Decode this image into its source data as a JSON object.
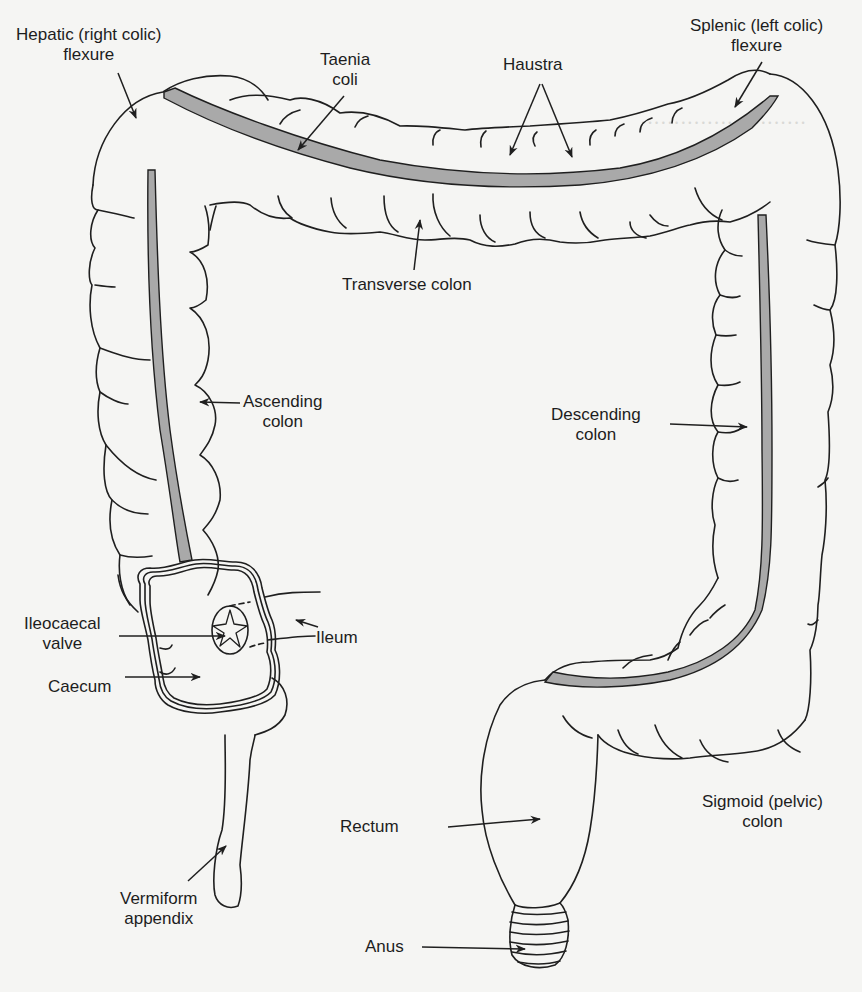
{
  "figure": {
    "colors": {
      "background": "#f5f5f3",
      "outline": "#1f1f1f",
      "taenia_fill": "#a9a9a9",
      "text": "#1d1d1d"
    }
  },
  "labels": {
    "hepatic_flexure": {
      "line1": "Hepatic (right colic)",
      "line2": "flexure"
    },
    "taenia_coli": {
      "line1": "Taenia",
      "line2": "coli"
    },
    "haustra": {
      "line1": "Haustra"
    },
    "splenic_flexure": {
      "line1": "Splenic (left colic)",
      "line2": "flexure"
    },
    "transverse_colon": {
      "line1": "Transverse colon"
    },
    "ascending_colon": {
      "line1": "Ascending",
      "line2": "colon"
    },
    "descending_colon": {
      "line1": "Descending",
      "line2": "colon"
    },
    "ileocaecal_valve": {
      "line1": "Ileocaecal",
      "line2": "valve"
    },
    "ileum": {
      "line1": "Ileum"
    },
    "caecum": {
      "line1": "Caecum"
    },
    "sigmoid_colon": {
      "line1": "Sigmoid (pelvic)",
      "line2": "colon"
    },
    "rectum": {
      "line1": "Rectum"
    },
    "vermiform_appendix": {
      "line1": "Vermiform",
      "line2": "appendix"
    },
    "anus": {
      "line1": "Anus"
    }
  }
}
